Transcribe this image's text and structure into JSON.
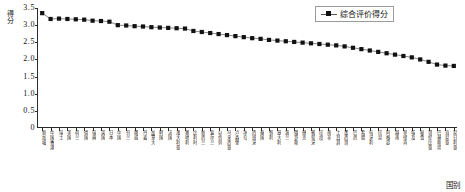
{
  "chart_data": {
    "type": "line",
    "title": "",
    "xlabel": "国别",
    "ylabel": "得分",
    "ylim": [
      0,
      3.5
    ],
    "yticks": [
      "0",
      "0.5",
      "1.0",
      "1.5",
      "2.0",
      "2.5",
      "3.0",
      "3.5"
    ],
    "ytick_values": [
      0,
      0.5,
      1.0,
      1.5,
      2.0,
      2.5,
      3.0,
      3.5
    ],
    "grid": false,
    "legend_position": "top-right",
    "legend": [
      "综合评价得分"
    ],
    "marker": "square",
    "series": [
      {
        "name": "综合评价得分",
        "values": [
          3.35,
          3.18,
          3.19,
          3.18,
          3.17,
          3.16,
          3.13,
          3.12,
          3.1,
          3.0,
          2.99,
          2.97,
          2.96,
          2.94,
          2.93,
          2.92,
          2.91,
          2.9,
          2.83,
          2.8,
          2.77,
          2.74,
          2.71,
          2.68,
          2.65,
          2.62,
          2.6,
          2.57,
          2.55,
          2.53,
          2.51,
          2.49,
          2.47,
          2.45,
          2.43,
          2.41,
          2.38,
          2.34,
          2.3,
          2.26,
          2.22,
          2.18,
          2.14,
          2.1,
          2.06,
          2.0,
          1.93,
          1.85,
          1.82,
          1.81
        ]
      }
    ],
    "categories": [
      "新加坡",
      "中国香港",
      "瑞士",
      "美国",
      "荷兰",
      "德国",
      "瑞典",
      "英国",
      "日本",
      "中国",
      "芬兰",
      "挪威",
      "丹麦",
      "加拿大",
      "韩国",
      "法国",
      "澳大利亚",
      "奥地利",
      "比利时",
      "新西兰",
      "爱尔兰",
      "以色列",
      "马来西亚",
      "卢森堡",
      "冰岛",
      "西班牙",
      "泰国",
      "智利",
      "意大利",
      "波兰",
      "俄罗斯",
      "捷克",
      "葡萄牙",
      "印度",
      "南非",
      "土耳其",
      "墨西哥",
      "巴西",
      "希腊",
      "匈牙利",
      "印尼",
      "阿根廷",
      "越南",
      "菲律宾",
      "埃及",
      "秘鲁",
      "哥伦比亚",
      "巴基斯坦",
      "肯尼亚",
      "尼日利亚"
    ]
  }
}
